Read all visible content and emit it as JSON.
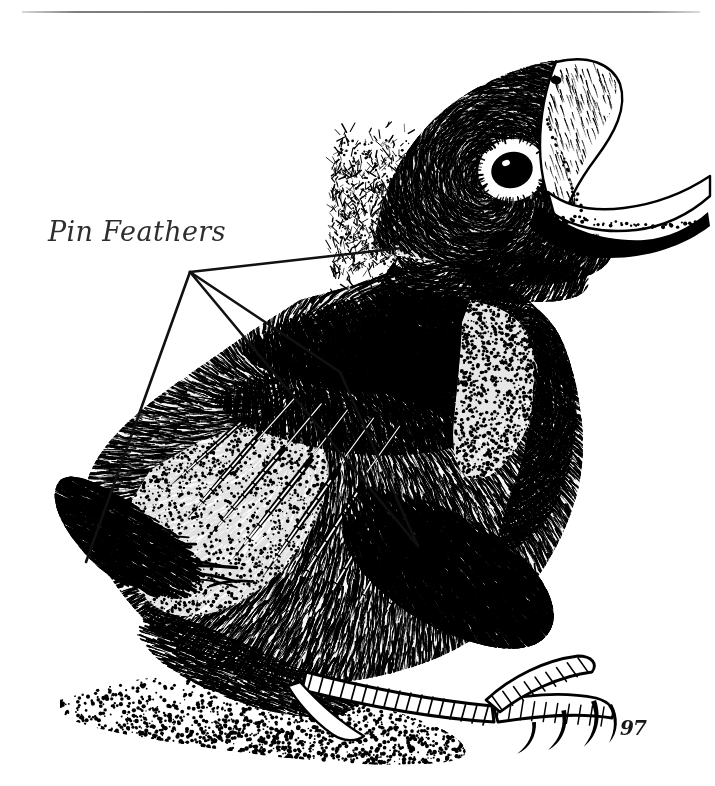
{
  "figure": {
    "title": "Pin Feathers",
    "medium": "pen-and-ink stipple and hatch illustration",
    "background_color": "#ffffff",
    "ink_color": "#000000",
    "width": 715,
    "height": 786
  },
  "top_rule": {
    "present": true,
    "color": "#6e6e6e",
    "x": 22,
    "y": 11,
    "width": 678,
    "height": 2
  },
  "annotations": [
    {
      "label": "Pin Feathers",
      "style": "italic",
      "color": "#2e2e2e",
      "font_size": 27,
      "x": 48,
      "y": 216
    }
  ],
  "leader_lines": {
    "color": "#111111",
    "stroke_width": 2.6,
    "hub": {
      "x": 190,
      "y": 272
    },
    "segments": [
      {
        "name": "hub-to-head",
        "x1": 190,
        "y1": 272,
        "x2": 402,
        "y2": 248
      },
      {
        "name": "hub-to-wingtip",
        "x1": 190,
        "y1": 272,
        "x2": 86,
        "y2": 562
      },
      {
        "name": "hub-to-scapular",
        "x1": 190,
        "y1": 272,
        "x2": 418,
        "y2": 546
      },
      {
        "name": "hub-to-coverts",
        "x1": 190,
        "y1": 272,
        "x2": 340,
        "y2": 372
      },
      {
        "name": "coverts-to-flank",
        "x1": 340,
        "y1": 372,
        "x2": 418,
        "y2": 546
      }
    ]
  },
  "signature": {
    "monogram": "℘",
    "year": "97",
    "text": "97",
    "x": 620,
    "y": 716
  },
  "anatomy_labels": [
    "gaping-beak",
    "eye",
    "ear-opening",
    "crown-down",
    "nape",
    "breast-stipple",
    "wing-coverts",
    "primary-pin-feathers",
    "tail",
    "tarsus",
    "toes",
    "claws"
  ]
}
